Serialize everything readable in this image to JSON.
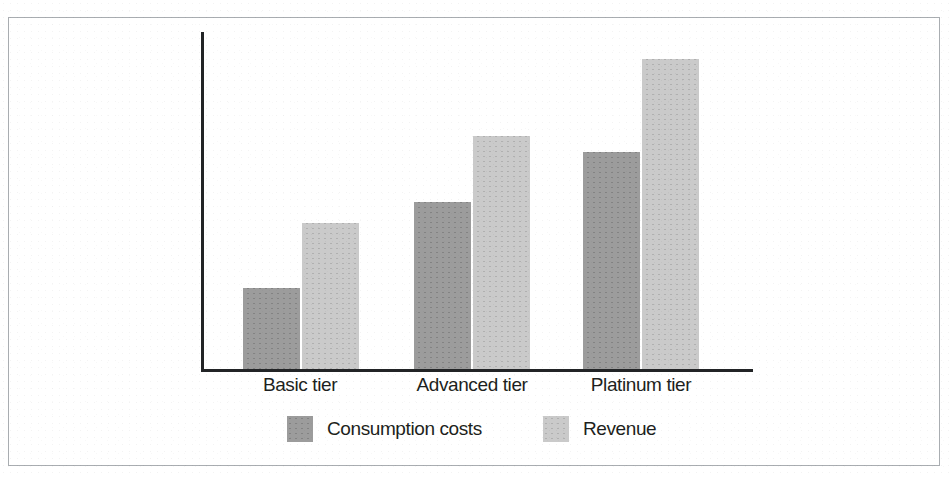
{
  "figure": {
    "frame_color": "#a9adb1",
    "background": "#ffffff",
    "axis_color": "#222426"
  },
  "legend": {
    "position": "bottom-center",
    "items": [
      {
        "label": "Consumption costs",
        "color": "#9c9c9c",
        "swatch_name": "legend-swatch-consumption-costs"
      },
      {
        "label": "Revenue",
        "color": "#cacaca",
        "swatch_name": "legend-swatch-revenue"
      }
    ]
  },
  "chart_data": {
    "type": "bar",
    "title": "",
    "subtitle": "",
    "xlabel": "",
    "ylabel": "",
    "categories": [
      "Basic tier",
      "Advanced tier",
      "Platinum tier"
    ],
    "series": [
      {
        "name": "Consumption costs",
        "color": "#9c9c9c",
        "values": [
          26,
          54,
          70
        ]
      },
      {
        "name": "Revenue",
        "color": "#cacaca",
        "values": [
          47,
          75,
          100
        ]
      }
    ],
    "ylim": [
      0,
      110
    ],
    "grid": false,
    "y_axis_ticks": [],
    "legend_position": "bottom-center",
    "annotations": []
  },
  "layout": {
    "plot": {
      "baseline_y": 369,
      "axis_x_left": 201,
      "axis_x_right": 753,
      "axis_y_top": 32,
      "max_bar_px": 310,
      "bar_width_px": 57
    },
    "groups": [
      {
        "category_center_x": 300,
        "bars_left_x": [
          243,
          302
        ]
      },
      {
        "category_center_x": 472,
        "bars_left_x": [
          414,
          473
        ]
      },
      {
        "category_center_x": 641,
        "bars_left_x": [
          583,
          642
        ]
      }
    ],
    "legend_items_left_x": [
      287,
      543
    ]
  }
}
